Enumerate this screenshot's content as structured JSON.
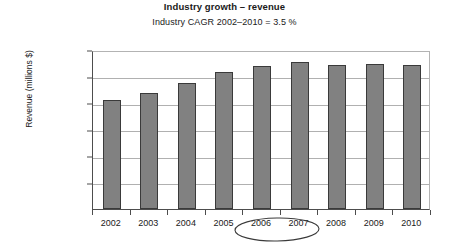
{
  "chart_data": {
    "type": "bar",
    "title": "Industry growth – revenue",
    "subtitle": "Industry CAGR 2002–2010 = 3.5 %",
    "xlabel": "",
    "ylabel": "Revenue (millions $)",
    "categories": [
      "2002",
      "2003",
      "2004",
      "2005",
      "2006",
      "2007",
      "2008",
      "2009",
      "2010"
    ],
    "values": [
      205000,
      218000,
      237000,
      258000,
      270000,
      277000,
      271000,
      274000,
      272000
    ],
    "ylim": [
      0,
      300000
    ],
    "ytick_values": [
      0,
      50000,
      100000,
      150000,
      200000,
      250000,
      300000
    ],
    "ytick_labels": [
      "0",
      "50,000",
      "100,000",
      "150,000",
      "200,000",
      "250,000",
      "300,000"
    ],
    "grid": "horizontal",
    "legend": "none",
    "bar_color": "#818181",
    "bar_border_color": "#3a3a3a",
    "grid_color": "#b0b0b0",
    "axis_color": "#4d4d4d",
    "annotations": [
      {
        "name": "highlight-ellipse",
        "kind": "hand-drawn-ellipse",
        "encircles": [
          "2006",
          "2007"
        ],
        "color": "#3a3a3a"
      }
    ]
  }
}
